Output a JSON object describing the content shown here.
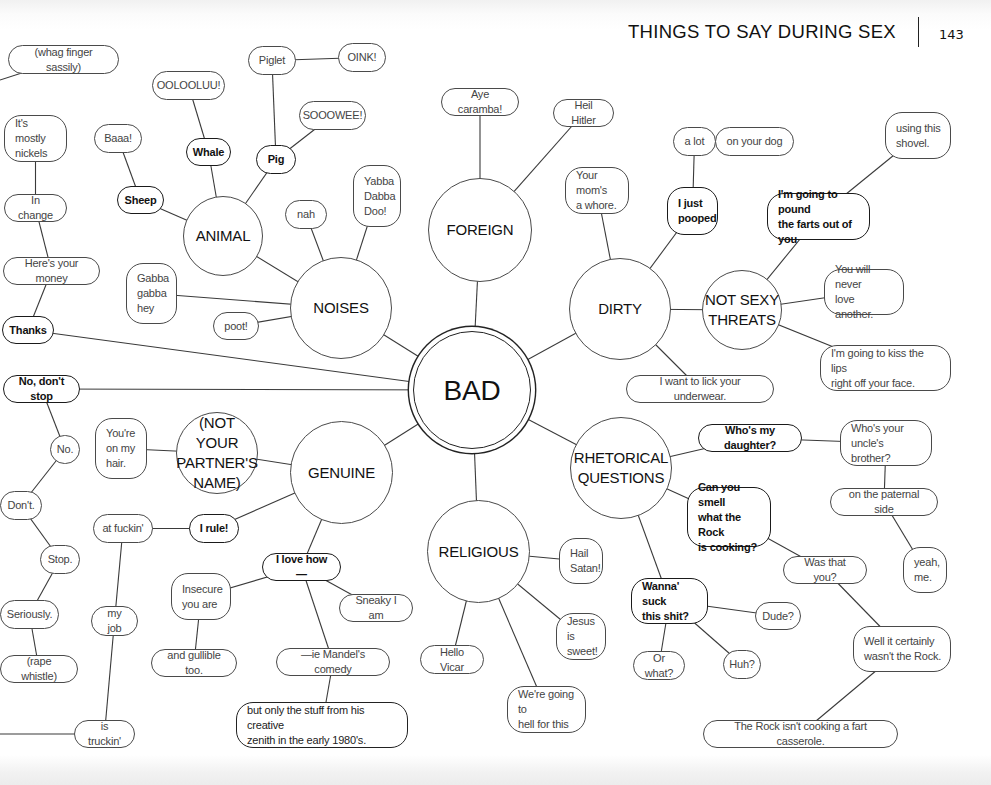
{
  "header": {
    "title": "THINGS TO SAY DURING SEX",
    "page_number": "143"
  },
  "nodes": [
    {
      "id": "bad",
      "label": "BAD",
      "type": "hub",
      "x": 413,
      "y": 331,
      "w": 118,
      "h": 118
    },
    {
      "id": "animal",
      "label": "ANIMAL",
      "type": "circle",
      "x": 183,
      "y": 196,
      "w": 80,
      "h": 80
    },
    {
      "id": "noises",
      "label": "NOISES",
      "type": "circle",
      "x": 290,
      "y": 257,
      "w": 102,
      "h": 102
    },
    {
      "id": "foreign",
      "label": "FOREIGN",
      "type": "circle",
      "x": 428,
      "y": 178,
      "w": 104,
      "h": 104
    },
    {
      "id": "dirty",
      "label": "DIRTY",
      "type": "circle",
      "x": 569,
      "y": 258,
      "w": 102,
      "h": 102
    },
    {
      "id": "threats",
      "label": "NOT SEXY\nTHREATS",
      "type": "circle",
      "x": 702,
      "y": 270,
      "w": 80,
      "h": 80
    },
    {
      "id": "genuine",
      "label": "GENUINE",
      "type": "circle",
      "x": 290,
      "y": 421,
      "w": 103,
      "h": 103
    },
    {
      "id": "notpartner",
      "label": "(NOT YOUR\nPARTNER'S\nNAME)",
      "type": "circle",
      "x": 176,
      "y": 412,
      "w": 82,
      "h": 82
    },
    {
      "id": "religious",
      "label": "RELIGIOUS",
      "type": "circle",
      "x": 427,
      "y": 500,
      "w": 103,
      "h": 103
    },
    {
      "id": "rhetorical",
      "label": "RHETORICAL\nQUESTIONS",
      "type": "circle",
      "x": 570,
      "y": 417,
      "w": 102,
      "h": 102
    },
    {
      "id": "whag",
      "label": "(whag finger sassily)",
      "type": "pill",
      "x": 8,
      "y": 45,
      "w": 111,
      "h": 29
    },
    {
      "id": "ooloo",
      "label": "OOLOOLUU!",
      "type": "pill",
      "x": 152,
      "y": 71,
      "w": 73,
      "h": 29
    },
    {
      "id": "piglet",
      "label": "Piglet",
      "type": "pill",
      "x": 248,
      "y": 46,
      "w": 48,
      "h": 29
    },
    {
      "id": "oink",
      "label": "OINK!",
      "type": "pill",
      "x": 338,
      "y": 43,
      "w": 48,
      "h": 29
    },
    {
      "id": "sooowee",
      "label": "SOOOWEE!",
      "type": "pill",
      "x": 299,
      "y": 101,
      "w": 67,
      "h": 29
    },
    {
      "id": "mostly",
      "label": "It's mostly\nnickels",
      "type": "box",
      "x": 4,
      "y": 115,
      "w": 63,
      "h": 47
    },
    {
      "id": "baaa",
      "label": "Baaa!",
      "type": "pill",
      "x": 94,
      "y": 124,
      "w": 48,
      "h": 29
    },
    {
      "id": "whale",
      "label": "Whale",
      "type": "pill-bold",
      "x": 186,
      "y": 138,
      "w": 45,
      "h": 28
    },
    {
      "id": "pig",
      "label": "Pig",
      "type": "pill-bold",
      "x": 256,
      "y": 145,
      "w": 40,
      "h": 29
    },
    {
      "id": "sheep",
      "label": "Sheep",
      "type": "pill-bold",
      "x": 117,
      "y": 186,
      "w": 47,
      "h": 28
    },
    {
      "id": "yabba",
      "label": "Yabba\nDabba\nDoo!",
      "type": "box",
      "x": 353,
      "y": 165,
      "w": 48,
      "h": 62
    },
    {
      "id": "nah",
      "label": "nah",
      "type": "pill",
      "x": 285,
      "y": 200,
      "w": 42,
      "h": 29
    },
    {
      "id": "inchange",
      "label": "In change",
      "type": "pill",
      "x": 4,
      "y": 194,
      "w": 63,
      "h": 28
    },
    {
      "id": "money",
      "label": "Here's your money",
      "type": "pill",
      "x": 3,
      "y": 257,
      "w": 97,
      "h": 28
    },
    {
      "id": "gabba",
      "label": "Gabba\ngabba\nhey",
      "type": "box",
      "x": 126,
      "y": 263,
      "w": 51,
      "h": 61
    },
    {
      "id": "poot",
      "label": "poot!",
      "type": "pill",
      "x": 213,
      "y": 312,
      "w": 46,
      "h": 28
    },
    {
      "id": "thanks",
      "label": "Thanks",
      "type": "pill-bold",
      "x": 2,
      "y": 316,
      "w": 52,
      "h": 28
    },
    {
      "id": "nodontstop",
      "label": "No, don't stop",
      "type": "pill-bold",
      "x": 3,
      "y": 375,
      "w": 77,
      "h": 28
    },
    {
      "id": "hairs",
      "label": "You're\non my\nhair.",
      "type": "box",
      "x": 95,
      "y": 418,
      "w": 52,
      "h": 61
    },
    {
      "id": "no",
      "label": "No.",
      "type": "pill",
      "x": 50,
      "y": 435,
      "w": 30,
      "h": 29
    },
    {
      "id": "dont",
      "label": "Don't.",
      "type": "pill",
      "x": 0,
      "y": 491,
      "w": 42,
      "h": 29
    },
    {
      "id": "atfuckin",
      "label": "at fuckin'",
      "type": "pill",
      "x": 93,
      "y": 514,
      "w": 60,
      "h": 29
    },
    {
      "id": "irule",
      "label": "I rule!",
      "type": "pill-bold",
      "x": 189,
      "y": 514,
      "w": 50,
      "h": 29
    },
    {
      "id": "stop",
      "label": "Stop.",
      "type": "pill",
      "x": 40,
      "y": 545,
      "w": 40,
      "h": 29
    },
    {
      "id": "ilovehow",
      "label": "I love how—",
      "type": "pill-bold",
      "x": 262,
      "y": 553,
      "w": 79,
      "h": 28
    },
    {
      "id": "insecure",
      "label": "Insecure\nyou are",
      "type": "box",
      "x": 171,
      "y": 573,
      "w": 60,
      "h": 47
    },
    {
      "id": "sneaky",
      "label": "Sneaky I am",
      "type": "pill",
      "x": 339,
      "y": 594,
      "w": 74,
      "h": 28
    },
    {
      "id": "seriously",
      "label": "Seriously.",
      "type": "pill",
      "x": 0,
      "y": 600,
      "w": 59,
      "h": 29
    },
    {
      "id": "myjob",
      "label": "my job",
      "type": "pill",
      "x": 91,
      "y": 606,
      "w": 47,
      "h": 30
    },
    {
      "id": "gullible",
      "label": "and gullible too.",
      "type": "pill",
      "x": 151,
      "y": 649,
      "w": 86,
      "h": 28
    },
    {
      "id": "mandel",
      "label": "—ie Mandel's comedy",
      "type": "pill",
      "x": 276,
      "y": 648,
      "w": 114,
      "h": 28
    },
    {
      "id": "rape",
      "label": "(rape whistle)",
      "type": "pill",
      "x": 0,
      "y": 655,
      "w": 78,
      "h": 28
    },
    {
      "id": "zenith",
      "label": "but only the stuff from his creative\nzenith in the early 1980's.",
      "type": "box-bold-thin",
      "x": 236,
      "y": 702,
      "w": 172,
      "h": 46
    },
    {
      "id": "truckin",
      "label": "is truckin'",
      "type": "pill",
      "x": 74,
      "y": 720,
      "w": 61,
      "h": 28
    },
    {
      "id": "caramba",
      "label": "Aye caramba!",
      "type": "pill",
      "x": 441,
      "y": 88,
      "w": 78,
      "h": 28
    },
    {
      "id": "hitler",
      "label": "Heil Hitler",
      "type": "pill",
      "x": 553,
      "y": 99,
      "w": 61,
      "h": 28
    },
    {
      "id": "alot",
      "label": "a lot",
      "type": "pill",
      "x": 673,
      "y": 127,
      "w": 43,
      "h": 29
    },
    {
      "id": "yourdog",
      "label": "on your dog",
      "type": "pill",
      "x": 715,
      "y": 127,
      "w": 79,
      "h": 29
    },
    {
      "id": "shovel",
      "label": "using this\nshovel.",
      "type": "box",
      "x": 885,
      "y": 112,
      "w": 66,
      "h": 47
    },
    {
      "id": "mom",
      "label": "Your mom's\na whore.",
      "type": "box",
      "x": 565,
      "y": 167,
      "w": 64,
      "h": 47
    },
    {
      "id": "pooped",
      "label": "I just\npooped",
      "type": "box-bold",
      "x": 667,
      "y": 187,
      "w": 51,
      "h": 48
    },
    {
      "id": "pound",
      "label": "I'm going to pound\nthe farts out of you",
      "type": "box-bold",
      "x": 767,
      "y": 193,
      "w": 103,
      "h": 47
    },
    {
      "id": "neverlove",
      "label": "You will never\nlove another.",
      "type": "box",
      "x": 824,
      "y": 269,
      "w": 80,
      "h": 46
    },
    {
      "id": "kisslips",
      "label": "I'm going to kiss the lips\nright off your face.",
      "type": "box",
      "x": 820,
      "y": 345,
      "w": 131,
      "h": 46
    },
    {
      "id": "underwear",
      "label": "I want to lick your underwear.",
      "type": "pill",
      "x": 626,
      "y": 375,
      "w": 148,
      "h": 28
    },
    {
      "id": "daughter",
      "label": "Who's my daughter?",
      "type": "pill-bold",
      "x": 698,
      "y": 424,
      "w": 104,
      "h": 28
    },
    {
      "id": "uncle",
      "label": "Who's your\nuncle's brother?",
      "type": "box",
      "x": 840,
      "y": 420,
      "w": 92,
      "h": 46
    },
    {
      "id": "rocksmell",
      "label": "Can you smell\nwhat the Rock\nis cooking?",
      "type": "box-bold",
      "x": 687,
      "y": 487,
      "w": 84,
      "h": 60
    },
    {
      "id": "paternal",
      "label": "on the paternal side",
      "type": "pill",
      "x": 830,
      "y": 488,
      "w": 108,
      "h": 28
    },
    {
      "id": "hail",
      "label": "Hail\nSatan!",
      "type": "box",
      "x": 559,
      "y": 538,
      "w": 44,
      "h": 46
    },
    {
      "id": "yeahme",
      "label": "yeah,\nme.",
      "type": "box",
      "x": 903,
      "y": 547,
      "w": 44,
      "h": 46
    },
    {
      "id": "wasthat",
      "label": "Was that you?",
      "type": "pill",
      "x": 783,
      "y": 556,
      "w": 84,
      "h": 28
    },
    {
      "id": "wannasuck",
      "label": "Wanna' suck\nthis shit?",
      "type": "box-bold",
      "x": 631,
      "y": 578,
      "w": 77,
      "h": 46
    },
    {
      "id": "dude",
      "label": "Dude?",
      "type": "pill",
      "x": 755,
      "y": 602,
      "w": 46,
      "h": 28
    },
    {
      "id": "jesus",
      "label": "Jesus is\nsweet!",
      "type": "box",
      "x": 556,
      "y": 613,
      "w": 50,
      "h": 47
    },
    {
      "id": "wellrock",
      "label": "Well it certainly\nwasn't the Rock.",
      "type": "box",
      "x": 853,
      "y": 626,
      "w": 98,
      "h": 46
    },
    {
      "id": "hellovicar",
      "label": "Hello Vicar",
      "type": "pill",
      "x": 420,
      "y": 645,
      "w": 64,
      "h": 29
    },
    {
      "id": "orwhat",
      "label": "Or what?",
      "type": "pill",
      "x": 633,
      "y": 651,
      "w": 52,
      "h": 29
    },
    {
      "id": "huh",
      "label": "Huh?",
      "type": "pill",
      "x": 723,
      "y": 650,
      "w": 38,
      "h": 29
    },
    {
      "id": "hellthis",
      "label": "We're going to\nhell for this",
      "type": "box",
      "x": 507,
      "y": 686,
      "w": 79,
      "h": 47
    },
    {
      "id": "fartcasserole",
      "label": "The Rock isn't cooking a fart casserole.",
      "type": "pill",
      "x": 703,
      "y": 720,
      "w": 195,
      "h": 28
    }
  ],
  "edges": [
    [
      "bad",
      "noises"
    ],
    [
      "bad",
      "foreign"
    ],
    [
      "bad",
      "dirty"
    ],
    [
      "bad",
      "genuine"
    ],
    [
      "bad",
      "religious"
    ],
    [
      "bad",
      "rhetorical"
    ],
    [
      "bad",
      "thanks"
    ],
    [
      "bad",
      "nodontstop"
    ],
    [
      "noises",
      "animal"
    ],
    [
      "noises",
      "nah"
    ],
    [
      "noises",
      "yabba"
    ],
    [
      "noises",
      "gabba"
    ],
    [
      "noises",
      "poot"
    ],
    [
      "animal",
      "sheep"
    ],
    [
      "animal",
      "whale"
    ],
    [
      "animal",
      "pig"
    ],
    [
      "sheep",
      "baaa"
    ],
    [
      "whale",
      "ooloo"
    ],
    [
      "pig",
      "piglet"
    ],
    [
      "pig",
      "sooowee"
    ],
    [
      "piglet",
      "oink"
    ],
    [
      "thanks",
      "money"
    ],
    [
      "money",
      "inchange"
    ],
    [
      "inchange",
      "mostly"
    ],
    [
      "foreign",
      "caramba"
    ],
    [
      "foreign",
      "hitler"
    ],
    [
      "dirty",
      "mom"
    ],
    [
      "dirty",
      "pooped"
    ],
    [
      "dirty",
      "threats"
    ],
    [
      "dirty",
      "underwear"
    ],
    [
      "pooped",
      "alot"
    ],
    [
      "alot",
      "yourdog"
    ],
    [
      "threats",
      "pound"
    ],
    [
      "threats",
      "neverlove"
    ],
    [
      "threats",
      "kisslips"
    ],
    [
      "pound",
      "shovel"
    ],
    [
      "genuine",
      "notpartner"
    ],
    [
      "genuine",
      "irule"
    ],
    [
      "genuine",
      "ilovehow"
    ],
    [
      "notpartner",
      "hairs"
    ],
    [
      "irule",
      "atfuckin"
    ],
    [
      "atfuckin",
      "myjob"
    ],
    [
      "myjob",
      "truckin"
    ],
    [
      "ilovehow",
      "insecure"
    ],
    [
      "ilovehow",
      "sneaky"
    ],
    [
      "ilovehow",
      "mandel"
    ],
    [
      "insecure",
      "gullible"
    ],
    [
      "mandel",
      "zenith"
    ],
    [
      "nodontstop",
      "no"
    ],
    [
      "no",
      "dont"
    ],
    [
      "dont",
      "stop"
    ],
    [
      "stop",
      "seriously"
    ],
    [
      "seriously",
      "rape"
    ],
    [
      "religious",
      "hail"
    ],
    [
      "religious",
      "jesus"
    ],
    [
      "religious",
      "hellovicar"
    ],
    [
      "religious",
      "hellthis"
    ],
    [
      "rhetorical",
      "daughter"
    ],
    [
      "rhetorical",
      "rocksmell"
    ],
    [
      "rhetorical",
      "wannasuck"
    ],
    [
      "daughter",
      "uncle"
    ],
    [
      "uncle",
      "paternal"
    ],
    [
      "paternal",
      "yeahme"
    ],
    [
      "rocksmell",
      "wasthat"
    ],
    [
      "wasthat",
      "wellrock"
    ],
    [
      "wellrock",
      "fartcasserole"
    ],
    [
      "wannasuck",
      "dude"
    ],
    [
      "wannasuck",
      "orwhat"
    ],
    [
      "wannasuck",
      "huh"
    ]
  ],
  "offpage_edges": [
    {
      "from": "whag",
      "to_x": 0,
      "to_y": 80
    },
    {
      "from": "truckin",
      "to_x": 0,
      "to_y": 734
    }
  ]
}
